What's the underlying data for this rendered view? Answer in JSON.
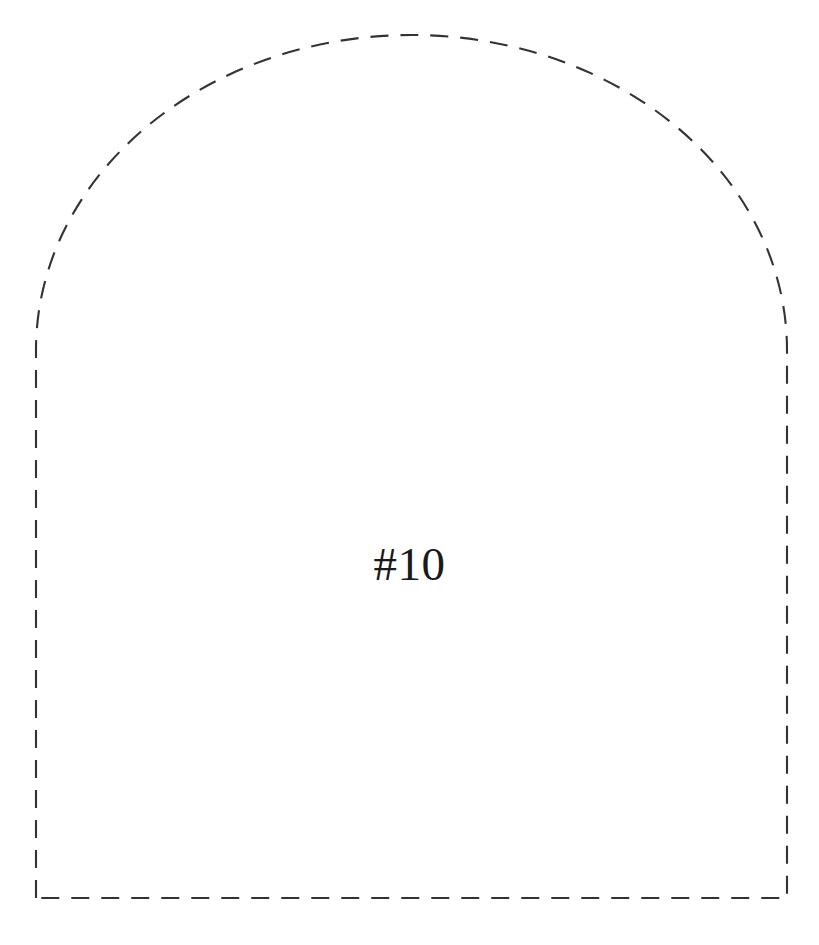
{
  "canvas": {
    "width": 819,
    "height": 945,
    "background_color": "#ffffff"
  },
  "pattern_piece": {
    "label": "#10",
    "label_color": "#1a1a1a",
    "outline": {
      "style": "dashed",
      "color": "#333333",
      "stroke_width": 2.1,
      "dash_length": 18,
      "gap_length": 12,
      "closed": true,
      "shape_name": "arched-tombstone",
      "geometry": {
        "left_x": 36,
        "right_x": 787,
        "bottom_y": 898,
        "apex_y": 35,
        "spring_line_y": 350,
        "center_x": 411.5,
        "arc_semi_axis_x": 375.5,
        "arc_semi_axis_y": 315
      },
      "path": "M 36 898 L 36 350 A 375.5 315 0 0 1 787 350 L 787 898 Z"
    }
  }
}
